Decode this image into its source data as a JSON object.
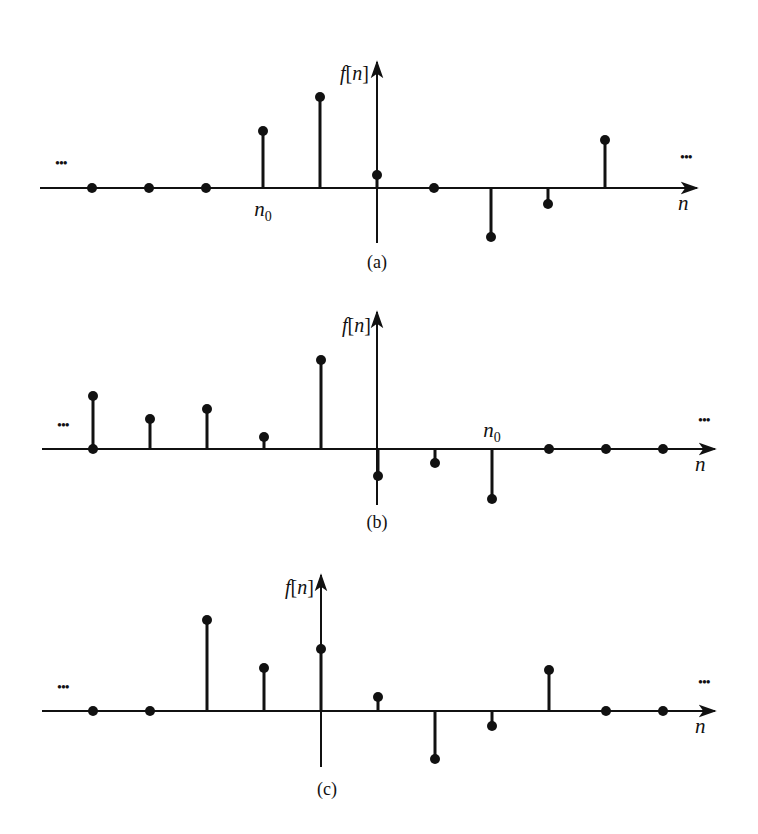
{
  "figure": {
    "panels": [
      {
        "id": "a",
        "caption": "(a)",
        "y_label": "f[n]",
        "x_label": "n",
        "ellipsis": "•••",
        "marker_label": "n",
        "marker_sub": "0",
        "marker_index": 3,
        "marker_position": "below",
        "axis_y": 188,
        "vaxis_x": 377,
        "vaxis_top": 62,
        "vaxis_bottom": 243,
        "haxis_start": 40,
        "haxis_end": 697,
        "x_positions": [
          92,
          149,
          206,
          263,
          320,
          377,
          434,
          491,
          548,
          605
        ],
        "heights_px": [
          0,
          0,
          0,
          57,
          91,
          13,
          0,
          -49,
          -16,
          48
        ],
        "caption_y": 268,
        "ylabel_pos": [
          340,
          80
        ],
        "xlabel_pos": [
          678,
          210
        ],
        "ellipsis_left": [
          55,
          168
        ],
        "ellipsis_right": [
          680,
          162
        ]
      },
      {
        "id": "b",
        "caption": "(b)",
        "y_label": "f[n]",
        "x_label": "n",
        "ellipsis": "•••",
        "marker_label": "n",
        "marker_sub": "0",
        "marker_index": 7,
        "marker_position": "above",
        "axis_y": 449,
        "vaxis_x": 377,
        "vaxis_top": 312,
        "vaxis_bottom": 505,
        "haxis_start": 42,
        "haxis_end": 715,
        "x_positions": [
          93,
          150,
          207,
          264,
          321,
          378,
          435,
          492,
          549,
          606,
          663
        ],
        "heights_px": [
          53,
          30,
          40,
          12,
          89,
          -27,
          -14,
          -50,
          0,
          0,
          0
        ],
        "extra_zero_dots": [
          0
        ],
        "caption_y": 528,
        "ylabel_pos": [
          342,
          332
        ],
        "xlabel_pos": [
          695,
          471
        ],
        "ellipsis_left": [
          57,
          430
        ],
        "ellipsis_right": [
          698,
          425
        ]
      },
      {
        "id": "c",
        "caption": "(c)",
        "y_label": "f[n]",
        "x_label": "n",
        "ellipsis": "•••",
        "axis_y": 711,
        "vaxis_x": 321,
        "vaxis_top": 575,
        "vaxis_bottom": 767,
        "haxis_start": 42,
        "haxis_end": 715,
        "x_positions": [
          93,
          150,
          207,
          264,
          321,
          378,
          435,
          492,
          549,
          606,
          663
        ],
        "heights_px": [
          0,
          0,
          91,
          43,
          62,
          14,
          -48,
          -15,
          41,
          0,
          0
        ],
        "caption_y": 795,
        "ylabel_pos": [
          285,
          594
        ],
        "xlabel_pos": [
          695,
          733
        ],
        "ellipsis_left": [
          57,
          692
        ],
        "ellipsis_right": [
          698,
          687
        ]
      }
    ],
    "bottom_caption": "(truncated caption text, illegible)"
  },
  "style": {
    "ink": "#111111",
    "background": "#ffffff"
  }
}
